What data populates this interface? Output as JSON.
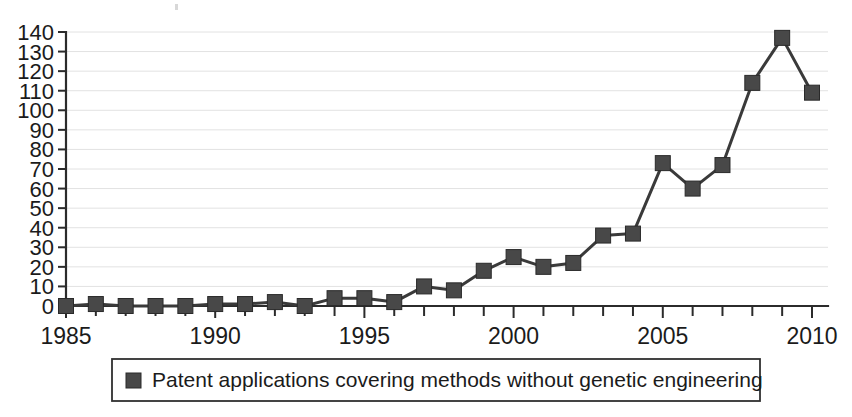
{
  "chart_data": {
    "type": "line",
    "title": "",
    "subtitle": "",
    "xlabel": "",
    "ylabel": "",
    "xlim": [
      1985,
      2010
    ],
    "ylim": [
      0,
      140
    ],
    "grid": true,
    "legend_position": "bottom",
    "marker": "square",
    "series_color": "#484848",
    "grid_color": "#e2e2e2",
    "axis_color": "#2b2b2b",
    "x": [
      1985,
      1986,
      1987,
      1988,
      1989,
      1990,
      1991,
      1992,
      1993,
      1994,
      1995,
      1996,
      1997,
      1998,
      1999,
      2000,
      2001,
      2002,
      2003,
      2004,
      2005,
      2006,
      2007,
      2008,
      2009,
      2010
    ],
    "series": [
      {
        "name": "Patent applications covering methods without genetic engineering",
        "values": [
          0,
          1,
          0,
          0,
          0,
          1,
          1,
          2,
          0,
          4,
          4,
          2,
          10,
          8,
          18,
          25,
          20,
          22,
          36,
          37,
          73,
          60,
          72,
          114,
          137,
          109
        ]
      }
    ],
    "ytick_labels": [
      "0",
      "10",
      "20",
      "30",
      "40",
      "50",
      "60",
      "70",
      "80",
      "90",
      "100",
      "110",
      "120",
      "130",
      "140"
    ],
    "ytick_values": [
      0,
      10,
      20,
      30,
      40,
      50,
      60,
      70,
      80,
      90,
      100,
      110,
      120,
      130,
      140
    ],
    "xtick_labels": [
      "1985",
      "1990",
      "1995",
      "2000",
      "2005",
      "2010"
    ],
    "xtick_values": [
      1985,
      1990,
      1995,
      2000,
      2005,
      2010
    ],
    "xtick_minor_values": [
      1986,
      1987,
      1988,
      1989,
      1991,
      1992,
      1993,
      1994,
      1996,
      1997,
      1998,
      1999,
      2001,
      2002,
      2003,
      2004,
      2006,
      2007,
      2008,
      2009
    ]
  },
  "legend": {
    "entries": [
      {
        "label": "Patent applications covering methods without genetic engineering",
        "swatch_color": "#484848"
      }
    ]
  }
}
